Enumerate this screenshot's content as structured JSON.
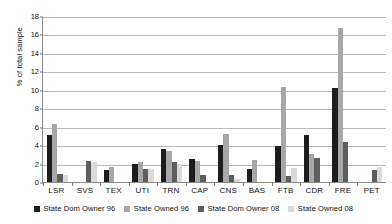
{
  "chart_data": {
    "type": "bar",
    "title": "",
    "subtitle": "",
    "xlabel": "",
    "ylabel": "% of total sample",
    "ylim": [
      0,
      18
    ],
    "ytick_step": 2,
    "yticks": [
      0,
      2,
      4,
      6,
      8,
      10,
      12,
      14,
      16,
      18
    ],
    "grid": true,
    "legend_position": "bottom",
    "categories": [
      "LSR",
      "SVS",
      "TEX",
      "UTI",
      "TRN",
      "CAP",
      "CNS",
      "BAS",
      "FTB",
      "CDR",
      "FRE",
      "PET"
    ],
    "series": [
      {
        "name": "State Dom Owner 96",
        "color": "#1d1d1d",
        "values": [
          5.1,
          0.0,
          1.3,
          2.0,
          3.6,
          2.5,
          4.0,
          1.4,
          3.9,
          5.1,
          10.2,
          0.0
        ]
      },
      {
        "name": "State Owned 96",
        "color": "#a8a8a8",
        "values": [
          6.3,
          0.0,
          1.6,
          2.2,
          3.4,
          2.3,
          5.2,
          2.4,
          10.3,
          3.0,
          16.7,
          0.0
        ]
      },
      {
        "name": "State Dom Owner 08",
        "color": "#5e5e5e",
        "values": [
          0.9,
          2.3,
          0.0,
          1.4,
          2.2,
          0.8,
          0.8,
          0.0,
          0.7,
          2.6,
          4.3,
          1.3
        ]
      },
      {
        "name": "State Owned 08",
        "color": "#dadada",
        "values": [
          0.8,
          2.2,
          0.0,
          1.4,
          2.0,
          0.0,
          0.3,
          0.0,
          1.5,
          0.0,
          0.0,
          1.6
        ]
      }
    ]
  }
}
